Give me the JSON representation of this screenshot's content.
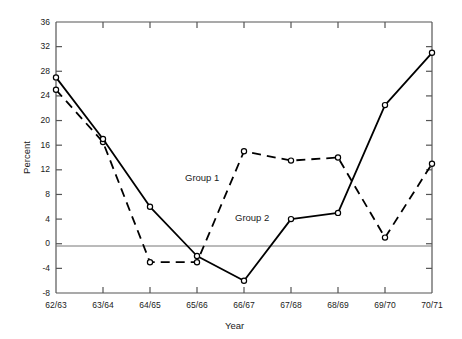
{
  "chart_data": {
    "type": "line",
    "title": "",
    "xlabel": "Year",
    "ylabel": "Percent",
    "categories": [
      "62/63",
      "63/64",
      "64/65",
      "65/66",
      "66/67",
      "67/68",
      "68/69",
      "69/70",
      "70/71"
    ],
    "ylim": [
      -8,
      36
    ],
    "yticks": [
      -8,
      -4,
      0,
      4,
      8,
      12,
      16,
      20,
      24,
      28,
      32,
      36
    ],
    "ytick_labels": [
      "-8",
      "-4",
      "0",
      "4",
      "8",
      "12",
      "16",
      "20",
      "24",
      "28",
      "32",
      "36"
    ],
    "grid": false,
    "zero_line": true,
    "legend": "inline-annotations",
    "series": [
      {
        "name": "Group 1",
        "style": "dashed",
        "marker": "open-circle",
        "color": "#000000",
        "values": [
          25.0,
          16.5,
          -3.0,
          -3.0,
          15.0,
          13.5,
          14.0,
          1.0,
          13.0
        ],
        "label_x": 185,
        "label_y": 172
      },
      {
        "name": "Group 2",
        "style": "solid",
        "marker": "open-circle",
        "color": "#000000",
        "values": [
          27.0,
          17.0,
          6.0,
          -2.0,
          -6.0,
          4.0,
          5.0,
          22.5,
          31.0
        ],
        "label_x": 235,
        "label_y": 212
      }
    ]
  },
  "annotations": {
    "group1_label": "Group 1",
    "group2_label": "Group 2"
  },
  "axes": {
    "x_title": "Year",
    "y_title": "Percent"
  }
}
